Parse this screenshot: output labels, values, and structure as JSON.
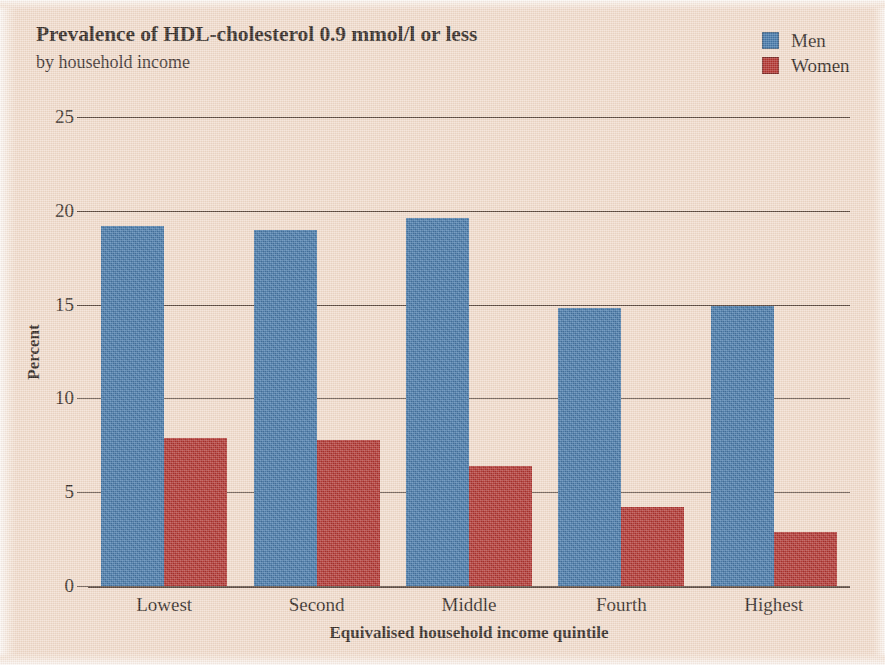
{
  "chart_data": {
    "type": "bar",
    "title": "Prevalence of HDL-cholesterol 0.9 mmol/l or less",
    "subtitle": "by household income",
    "xlabel": "Equivalised household income quintile",
    "ylabel": "Percent",
    "categories": [
      "Lowest",
      "Second",
      "Middle",
      "Fourth",
      "Highest"
    ],
    "series": [
      {
        "name": "Men",
        "color": "#2f6ba4",
        "values": [
          19.2,
          19.0,
          19.6,
          14.8,
          14.9
        ]
      },
      {
        "name": "Women",
        "color": "#a8201d",
        "values": [
          7.9,
          7.8,
          6.4,
          4.2,
          2.9
        ]
      }
    ],
    "ylim": [
      0,
      25
    ],
    "yticks": [
      0,
      5,
      10,
      15,
      20,
      25
    ],
    "ytick_labels": [
      "0",
      "5",
      "10",
      "15",
      "20",
      "25"
    ],
    "grid": true,
    "legend_position": "top-right",
    "background_color": "#f0dccd"
  }
}
